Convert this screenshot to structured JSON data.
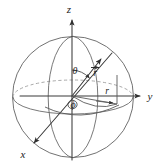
{
  "figure": {
    "background_color": "#ffffff",
    "line_color": "#3a3a3a",
    "sphere_color": "#6a6a6a",
    "hidden_line_color": "#9a9a9a",
    "label_color": "#1c1c1c",
    "width": 162,
    "height": 168
  },
  "labels": {
    "z_axis": "z",
    "y_axis": "y",
    "x_axis": "x",
    "theta": "θ",
    "phi": "ϕ",
    "r_vector": "r",
    "r_projection": "r"
  },
  "geometry": {
    "origin": {
      "x": 72,
      "y": 96
    },
    "sphere": {
      "cx": 73,
      "cy": 97,
      "rx": 60,
      "ry": 61
    },
    "equator_ellipse": {
      "cx": 73,
      "cy": 97,
      "rx": 60,
      "ry": 17
    },
    "meridian_ellipse": {
      "cx": 73,
      "cy": 97,
      "rx": 27,
      "ry": 61
    },
    "z_axis_tip": {
      "x": 72,
      "y": 16
    },
    "y_axis_tip": {
      "x": 144,
      "y": 96
    },
    "x_axis_tip": {
      "x": 30,
      "y": 147
    },
    "r_vector_tip": {
      "x": 104,
      "y": 56
    },
    "r_projection_end": {
      "x": 117,
      "y": 104
    },
    "theta_degrees": 50,
    "phi_degrees": 55
  },
  "elements": {
    "sphere_outline": "sphere-outline-circle",
    "equator_front": "equator-front-arc",
    "equator_back": "equator-back-arc-dashed",
    "meridian": "meridian-arc",
    "theta_arc": "theta-angle-arc",
    "phi_arc": "phi-angle-arc",
    "projection_drop": "vertical-projection-line"
  }
}
